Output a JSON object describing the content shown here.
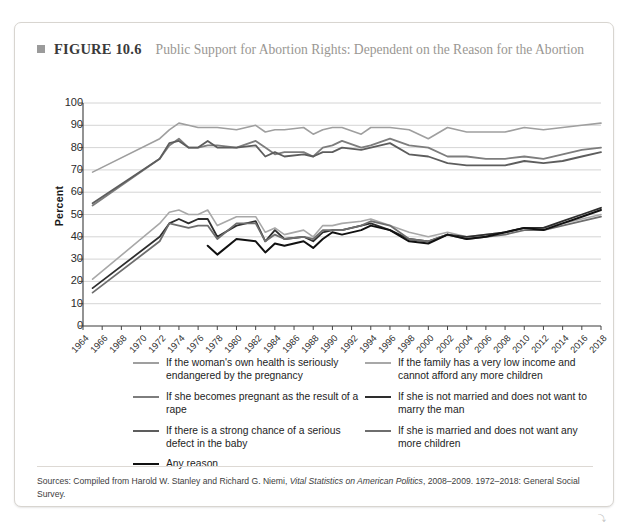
{
  "figure": {
    "bullet_icon": "square-bullet-icon",
    "label": "FIGURE 10.6",
    "title": "Public Support for Abortion Rights: Dependent on the Reason for the Abortion"
  },
  "sources": {
    "prefix": "Sources: Compiled from Harold W. Stanley and Richard G. Niemi, ",
    "italic": "Vital Statistics on American Politics",
    "suffix": ", 2008–2009. 1972–2018: General Social Survey."
  },
  "chart_data": {
    "type": "line",
    "title": "Public Support for Abortion Rights: Dependent on the Reason for the Abortion",
    "xlabel": "",
    "ylabel": "Percent",
    "ylim": [
      0,
      100
    ],
    "ytick_step": 10,
    "yticks": [
      100,
      90,
      80,
      70,
      60,
      50,
      40,
      30,
      20,
      10,
      0
    ],
    "grid": "horizontal",
    "legend_position": "below",
    "xlim": [
      1964,
      2018
    ],
    "x": [
      1964,
      1966,
      1968,
      1970,
      1972,
      1974,
      1976,
      1978,
      1980,
      1982,
      1984,
      1986,
      1988,
      1990,
      1992,
      1994,
      1996,
      1998,
      2000,
      2002,
      2004,
      2006,
      2008,
      2010,
      2012,
      2014,
      2016,
      2018
    ],
    "xtick_labels": [
      "1964",
      "1966",
      "1968",
      "1970",
      "1972",
      "1974",
      "1976",
      "1978",
      "1980",
      "1982",
      "1984",
      "1986",
      "1988",
      "1990",
      "1992",
      "1994",
      "1996",
      "1998",
      "2000",
      "2002",
      "2004",
      "2006",
      "2008",
      "2010",
      "2012",
      "2014",
      "2016",
      "2018"
    ],
    "series": [
      {
        "name": "If the woman's own health is seriously endangered by the pregnancy",
        "color": "#9f9f9f",
        "width": 1.6,
        "x": [
          1965,
          1972,
          1973,
          1974,
          1975,
          1976,
          1977,
          1978,
          1980,
          1982,
          1983,
          1984,
          1985,
          1987,
          1988,
          1989,
          1990,
          1991,
          1993,
          1994,
          1996,
          1998,
          2000,
          2002,
          2004,
          2006,
          2008,
          2010,
          2012,
          2014,
          2016,
          2018
        ],
        "values": [
          69,
          84,
          88,
          91,
          90,
          89,
          89,
          89,
          88,
          90,
          87,
          88,
          88,
          89,
          86,
          88,
          89,
          89,
          86,
          89,
          89,
          88,
          84,
          89,
          87,
          87,
          87,
          89,
          88,
          89,
          90,
          91
        ]
      },
      {
        "name": "If she becomes pregnant as the result of a rape",
        "color": "#7d7d7d",
        "width": 1.8,
        "x": [
          1965,
          1972,
          1973,
          1974,
          1975,
          1976,
          1977,
          1978,
          1980,
          1982,
          1983,
          1984,
          1985,
          1987,
          1988,
          1989,
          1990,
          1991,
          1993,
          1994,
          1996,
          1998,
          2000,
          2002,
          2004,
          2006,
          2008,
          2010,
          2012,
          2014,
          2016,
          2018
        ],
        "values": [
          54,
          75,
          81,
          84,
          80,
          80,
          81,
          81,
          80,
          83,
          80,
          77,
          78,
          78,
          76,
          80,
          81,
          83,
          80,
          81,
          84,
          81,
          80,
          76,
          76,
          75,
          75,
          76,
          75,
          77,
          79,
          80
        ]
      },
      {
        "name": "If there is a strong chance of a serious defect in the baby",
        "color": "#5d5d5d",
        "width": 1.8,
        "x": [
          1965,
          1972,
          1973,
          1974,
          1975,
          1976,
          1977,
          1978,
          1980,
          1982,
          1983,
          1984,
          1985,
          1987,
          1988,
          1989,
          1990,
          1991,
          1993,
          1994,
          1996,
          1998,
          2000,
          2002,
          2004,
          2006,
          2008,
          2010,
          2012,
          2014,
          2016,
          2018
        ],
        "values": [
          55,
          75,
          82,
          83,
          80,
          80,
          83,
          80,
          80,
          81,
          76,
          78,
          76,
          77,
          76,
          78,
          78,
          80,
          79,
          80,
          82,
          77,
          76,
          73,
          72,
          72,
          72,
          74,
          73,
          74,
          76,
          78
        ]
      },
      {
        "name": "If the family has a very low income and cannot afford any more children",
        "color": "#a8a8a8",
        "width": 1.6,
        "x": [
          1965,
          1972,
          1973,
          1974,
          1975,
          1976,
          1977,
          1978,
          1980,
          1982,
          1983,
          1984,
          1985,
          1987,
          1988,
          1989,
          1990,
          1991,
          1993,
          1994,
          1996,
          1998,
          2000,
          2002,
          2004,
          2006,
          2008,
          2010,
          2012,
          2014,
          2016,
          2018
        ],
        "values": [
          21,
          46,
          51,
          52,
          50,
          50,
          52,
          45,
          49,
          49,
          42,
          44,
          41,
          43,
          40,
          45,
          45,
          46,
          47,
          48,
          45,
          42,
          40,
          42,
          40,
          41,
          42,
          44,
          44,
          46,
          48,
          50
        ]
      },
      {
        "name": "If she is not married and does not want to marry the man",
        "color": "#2e2e2e",
        "width": 1.8,
        "x": [
          1965,
          1972,
          1973,
          1974,
          1975,
          1976,
          1977,
          1978,
          1980,
          1982,
          1983,
          1984,
          1985,
          1987,
          1988,
          1989,
          1990,
          1991,
          1993,
          1994,
          1996,
          1998,
          2000,
          2002,
          2004,
          2006,
          2008,
          2010,
          2012,
          2014,
          2016,
          2018
        ],
        "values": [
          17,
          40,
          46,
          48,
          46,
          48,
          48,
          40,
          45,
          47,
          38,
          43,
          39,
          40,
          38,
          42,
          43,
          43,
          45,
          46,
          43,
          39,
          38,
          41,
          40,
          41,
          42,
          44,
          44,
          47,
          50,
          53
        ]
      },
      {
        "name": "If she is married and does not want any more children",
        "color": "#6e6e6e",
        "width": 1.8,
        "x": [
          1965,
          1972,
          1973,
          1974,
          1975,
          1976,
          1977,
          1978,
          1980,
          1982,
          1983,
          1984,
          1985,
          1987,
          1988,
          1989,
          1990,
          1991,
          1993,
          1994,
          1996,
          1998,
          2000,
          2002,
          2004,
          2006,
          2008,
          2010,
          2012,
          2014,
          2016,
          2018
        ],
        "values": [
          15,
          38,
          46,
          45,
          44,
          45,
          45,
          39,
          46,
          46,
          38,
          41,
          39,
          40,
          39,
          43,
          43,
          43,
          45,
          47,
          45,
          39,
          38,
          41,
          39,
          40,
          41,
          43,
          43,
          45,
          47,
          49
        ]
      },
      {
        "name": "Any reason",
        "color": "#111111",
        "width": 2.0,
        "x": [
          1977,
          1978,
          1980,
          1982,
          1983,
          1984,
          1985,
          1987,
          1988,
          1989,
          1990,
          1991,
          1993,
          1994,
          1996,
          1998,
          2000,
          2002,
          2004,
          2006,
          2008,
          2010,
          2012,
          2014,
          2016,
          2018
        ],
        "values": [
          36,
          32,
          39,
          38,
          33,
          37,
          36,
          38,
          35,
          39,
          42,
          41,
          43,
          45,
          43,
          38,
          37,
          41,
          39,
          40,
          42,
          44,
          43,
          46,
          49,
          52
        ]
      }
    ]
  },
  "legend": {
    "left_column": [
      {
        "label": "If the woman's own health is seriously endangered by the pregnancy",
        "color": "#9f9f9f"
      },
      {
        "label": "If she becomes pregnant as the result of a rape",
        "color": "#7d7d7d"
      },
      {
        "label": "If there is a strong chance of a serious defect in the baby",
        "color": "#5d5d5d"
      },
      {
        "label": "Any reason",
        "color": "#111111"
      }
    ],
    "right_column": [
      {
        "label": "If the family has a very low income and cannot afford any more children",
        "color": "#a8a8a8"
      },
      {
        "label": "If she is not married and does not want to marry the man",
        "color": "#2e2e2e"
      },
      {
        "label": "If she is married and does not want any more children",
        "color": "#6e6e6e"
      }
    ]
  },
  "corner_mark": "⤵"
}
